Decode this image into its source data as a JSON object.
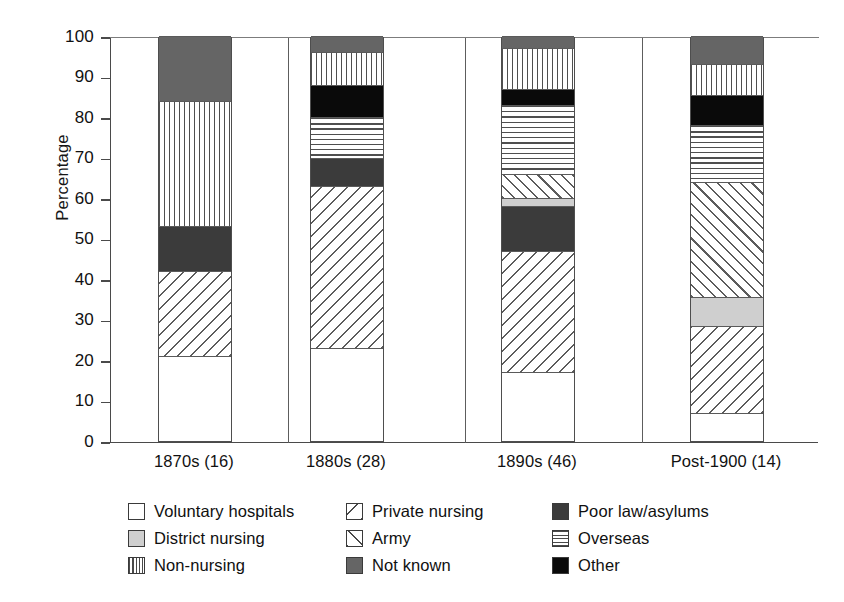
{
  "top_cut_text": "•  •  •    •  •    •    •",
  "chart_data": {
    "type": "bar",
    "subtype": "stacked-bar-100",
    "title": "",
    "xlabel": "",
    "ylabel": "Percentage",
    "ylim": [
      0,
      100
    ],
    "ytick_step": 10,
    "yticks": [
      100,
      90,
      80,
      70,
      60,
      50,
      40,
      30,
      20,
      10,
      0
    ],
    "grid": false,
    "legend_position": "bottom",
    "categories": [
      "1870s (16)",
      "1880s (28)",
      "1890s (46)",
      "Post-1900 (14)"
    ],
    "series": [
      {
        "name": "Voluntary hospitals",
        "pattern": "solid-white",
        "color": "#ffffff",
        "values": [
          21,
          23,
          17,
          7
        ]
      },
      {
        "name": "Private nursing",
        "pattern": "diagonal-back",
        "color": "#5c5c5c",
        "values": [
          21,
          40,
          30,
          21.5
        ]
      },
      {
        "name": "Poor law/asylums",
        "pattern": "solid-darkgray",
        "color": "#3b3b3b",
        "values": [
          11,
          7,
          11,
          0
        ]
      },
      {
        "name": "District nursing",
        "pattern": "solid-lightgray",
        "color": "#cfcfcf",
        "values": [
          0,
          0,
          2,
          7
        ]
      },
      {
        "name": "Army",
        "pattern": "diagonal-forward",
        "color": "#5c5c5c",
        "values": [
          0,
          0,
          6,
          28.5
        ]
      },
      {
        "name": "Overseas",
        "pattern": "horizontal-lines",
        "color": "#4f4f4f",
        "values": [
          0,
          10,
          17,
          14
        ]
      },
      {
        "name": "Other",
        "pattern": "solid-black",
        "color": "#0a0a0a",
        "values": [
          0,
          8,
          4,
          7.5
        ]
      },
      {
        "name": "Non-nursing",
        "pattern": "vertical-lines",
        "color": "#4f4f4f",
        "values": [
          31,
          8,
          10,
          7.5
        ]
      },
      {
        "name": "Not known",
        "pattern": "solid-medgray",
        "color": "#656565",
        "values": [
          16,
          4,
          3,
          7
        ]
      }
    ],
    "stack_order_bottom_to_top": [
      "Voluntary hospitals",
      "Private nursing",
      "Poor law/asylums",
      "District nursing",
      "Army",
      "Overseas",
      "Other",
      "Non-nursing",
      "Not known"
    ],
    "cumulative_boundaries": {
      "1870s (16)": [
        0,
        21,
        42,
        53,
        53,
        53,
        53,
        53,
        84,
        100
      ],
      "1880s (28)": [
        0,
        23,
        63,
        70,
        70,
        70,
        80,
        88,
        96,
        100
      ],
      "1890s (46)": [
        0,
        17,
        47,
        58,
        60,
        66,
        83,
        87,
        97,
        100
      ],
      "Post-1900 (14)": [
        0,
        7,
        28.5,
        28.5,
        35.5,
        64,
        78,
        85.5,
        93,
        100
      ]
    }
  },
  "legend": {
    "rows": [
      [
        {
          "label": "Voluntary hospitals",
          "swatch": "solid-white"
        },
        {
          "label": "Private nursing",
          "swatch": "diagonal-back"
        },
        {
          "label": "Poor law/asylums",
          "swatch": "solid-darkgray"
        }
      ],
      [
        {
          "label": "District nursing",
          "swatch": "solid-lightgray"
        },
        {
          "label": "Army",
          "swatch": "diagonal-forward"
        },
        {
          "label": "Overseas",
          "swatch": "horizontal-lines"
        }
      ],
      [
        {
          "label": "Non-nursing",
          "swatch": "vertical-lines"
        },
        {
          "label": "Not known",
          "swatch": "solid-medgray"
        },
        {
          "label": "Other",
          "swatch": "solid-black"
        }
      ]
    ]
  }
}
